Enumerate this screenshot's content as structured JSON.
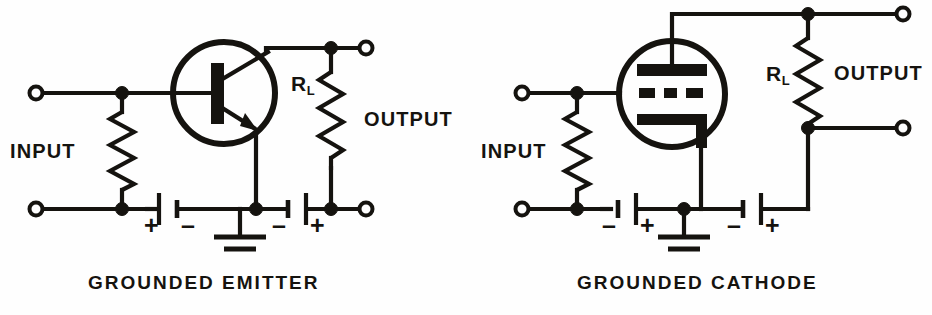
{
  "figure": {
    "background_color": "#fefefe",
    "ink_color": "#15130f",
    "width": 932,
    "height": 315
  },
  "circuits": [
    {
      "id": "grounded-emitter",
      "caption": "GROUNDED EMITTER",
      "caption_x": 88,
      "caption_y": 272,
      "active_device": {
        "kind": "transistor-npn",
        "envelope_cx": 224,
        "envelope_cy": 93,
        "envelope_r": 51,
        "base_bar_x": 211,
        "base_bar_y": 63,
        "base_bar_w": 13,
        "base_bar_h": 61
      },
      "labels": {
        "input": "INPUT",
        "input_x": 10,
        "input_y": 140,
        "output": "OUTPUT",
        "output_x": 364,
        "output_y": 108,
        "load_resistor": "R",
        "load_resistor_sub": "L",
        "load_resistor_x": 291,
        "load_resistor_y": 72
      },
      "batteries": [
        {
          "name": "bias-battery",
          "left_sign": "+",
          "right_sign": "–",
          "cx": 168,
          "cy": 209
        },
        {
          "name": "supply-battery",
          "left_sign": "–",
          "right_sign": "+",
          "cx": 297,
          "cy": 209
        }
      ],
      "terminals": [
        {
          "name": "input-top-terminal",
          "x": 36,
          "y": 93
        },
        {
          "name": "input-bottom-terminal",
          "x": 36,
          "y": 209
        },
        {
          "name": "output-top-terminal",
          "x": 366,
          "y": 48
        },
        {
          "name": "output-bottom-terminal",
          "x": 366,
          "y": 209
        }
      ],
      "nodes": [
        {
          "name": "input-top-node",
          "x": 122,
          "y": 93
        },
        {
          "name": "input-bottom-node",
          "x": 122,
          "y": 209
        },
        {
          "name": "collector-node",
          "x": 331,
          "y": 48
        },
        {
          "name": "load-bottom-node",
          "x": 331,
          "y": 209
        },
        {
          "name": "emitter-ground-node",
          "x": 240,
          "y": 209
        }
      ],
      "ground": {
        "name": "ground-symbol",
        "x": 240,
        "y": 209,
        "stem_to": 236
      }
    },
    {
      "id": "grounded-cathode",
      "caption": "GROUNDED CATHODE",
      "caption_x": 577,
      "caption_y": 272,
      "active_device": {
        "kind": "vacuum-tube-triode",
        "envelope_cx": 672,
        "envelope_cy": 94,
        "envelope_r": 53,
        "plate_x": 637,
        "plate_y": 64,
        "plate_w": 70,
        "plate_h": 12,
        "grid_y": 93,
        "grid_dashes": [
          [
            639,
            16
          ],
          [
            662,
            13
          ],
          [
            682,
            17
          ]
        ],
        "cathode_x": 637,
        "cathode_y": 114,
        "cathode_w": 70,
        "cathode_h": 11,
        "cathode_leg_h": 30
      },
      "labels": {
        "input": "INPUT",
        "input_x": 481,
        "input_y": 140,
        "output": "OUTPUT",
        "output_x": 834,
        "output_y": 62,
        "load_resistor": "R",
        "load_resistor_sub": "L",
        "load_resistor_x": 766,
        "load_resistor_y": 62
      },
      "batteries": [
        {
          "name": "bias-battery",
          "left_sign": "–",
          "right_sign": "+",
          "cx": 627,
          "cy": 209
        },
        {
          "name": "supply-battery",
          "left_sign": "–",
          "right_sign": "+",
          "cx": 752,
          "cy": 209
        }
      ],
      "terminals": [
        {
          "name": "input-top-terminal",
          "x": 522,
          "y": 93
        },
        {
          "name": "input-bottom-terminal",
          "x": 522,
          "y": 209
        },
        {
          "name": "output-top-terminal",
          "x": 903,
          "y": 14
        },
        {
          "name": "output-bottom-terminal",
          "x": 903,
          "y": 128
        }
      ],
      "nodes": [
        {
          "name": "input-top-node",
          "x": 577,
          "y": 93
        },
        {
          "name": "input-bottom-node",
          "x": 577,
          "y": 209
        },
        {
          "name": "plate-node",
          "x": 808,
          "y": 14
        },
        {
          "name": "output-tap-node",
          "x": 808,
          "y": 128
        },
        {
          "name": "cathode-ground-node",
          "x": 684,
          "y": 209
        }
      ],
      "ground": {
        "name": "ground-symbol",
        "x": 684,
        "y": 209,
        "stem_to": 236
      }
    }
  ]
}
